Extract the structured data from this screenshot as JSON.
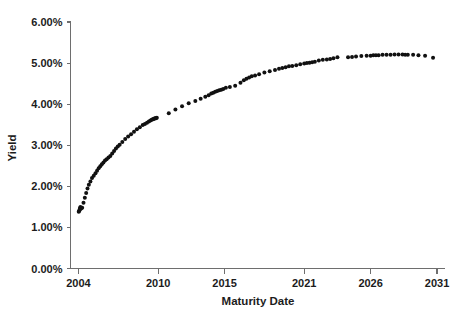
{
  "chart_data": {
    "type": "scatter",
    "title": "",
    "xlabel": "Maturity Date",
    "ylabel": "Yield",
    "xlim": [
      2003.4,
      2031.6
    ],
    "ylim": [
      0.0,
      6.0
    ],
    "grid": false,
    "legend": null,
    "marker": {
      "shape": "circle",
      "color": "#111111",
      "size": 2.0
    },
    "xticks": [
      2004,
      2010,
      2015,
      2021,
      2026,
      2031
    ],
    "xtick_labels": [
      "2004",
      "2010",
      "2015",
      "2021",
      "2026",
      "2031"
    ],
    "yticks": [
      0.0,
      1.0,
      2.0,
      3.0,
      4.0,
      5.0,
      6.0
    ],
    "ytick_labels": [
      "0.00%",
      "1.00%",
      "2.00%",
      "3.00%",
      "4.00%",
      "5.00%",
      "6.00%"
    ],
    "series": [
      {
        "name": "Yield curve",
        "x": [
          2004.02,
          2004.05,
          2004.08,
          2004.1,
          2004.12,
          2004.15,
          2004.2,
          2004.28,
          2004.38,
          2004.48,
          2004.58,
          2004.68,
          2004.78,
          2004.9,
          2005.02,
          2005.15,
          2005.28,
          2005.4,
          2005.52,
          2005.64,
          2005.76,
          2005.88,
          2006.0,
          2006.12,
          2006.26,
          2006.4,
          2006.54,
          2006.68,
          2006.82,
          2006.96,
          2007.1,
          2007.3,
          2007.52,
          2007.74,
          2007.96,
          2008.18,
          2008.4,
          2008.62,
          2008.84,
          2009.0,
          2009.16,
          2009.3,
          2009.42,
          2009.52,
          2009.6,
          2009.66,
          2009.72,
          2009.78,
          2009.84,
          2009.9,
          2010.8,
          2011.3,
          2011.8,
          2012.3,
          2012.8,
          2013.2,
          2013.55,
          2013.8,
          2014.0,
          2014.15,
          2014.3,
          2014.45,
          2014.6,
          2014.75,
          2014.9,
          2015.1,
          2015.4,
          2015.8,
          2016.2,
          2016.45,
          2016.65,
          2016.85,
          2017.05,
          2017.3,
          2017.6,
          2018.0,
          2018.4,
          2018.8,
          2019.1,
          2019.35,
          2019.6,
          2019.85,
          2020.1,
          2020.4,
          2020.7,
          2021.0,
          2021.2,
          2021.4,
          2021.6,
          2021.8,
          2022.1,
          2022.4,
          2022.7,
          2022.95,
          2023.2,
          2023.5,
          2024.3,
          2024.6,
          2024.9,
          2025.3,
          2025.7,
          2026.0,
          2026.2,
          2026.4,
          2026.6,
          2026.9,
          2027.2,
          2027.5,
          2027.8,
          2028.1,
          2028.4,
          2028.6,
          2028.8,
          2029.2,
          2029.6,
          2030.1,
          2030.7
        ],
        "y": [
          1.38,
          1.4,
          1.42,
          1.45,
          1.47,
          1.5,
          1.46,
          1.48,
          1.6,
          1.72,
          1.84,
          1.95,
          2.04,
          2.12,
          2.2,
          2.26,
          2.32,
          2.38,
          2.44,
          2.49,
          2.54,
          2.58,
          2.63,
          2.66,
          2.7,
          2.74,
          2.8,
          2.86,
          2.92,
          2.97,
          3.01,
          3.08,
          3.15,
          3.21,
          3.27,
          3.33,
          3.39,
          3.44,
          3.49,
          3.52,
          3.55,
          3.58,
          3.6,
          3.62,
          3.63,
          3.64,
          3.65,
          3.66,
          3.66,
          3.67,
          3.78,
          3.87,
          3.95,
          4.02,
          4.08,
          4.13,
          4.18,
          4.22,
          4.26,
          4.28,
          4.3,
          4.32,
          4.34,
          4.35,
          4.37,
          4.4,
          4.42,
          4.45,
          4.52,
          4.58,
          4.62,
          4.65,
          4.68,
          4.7,
          4.73,
          4.77,
          4.8,
          4.83,
          4.86,
          4.88,
          4.9,
          4.92,
          4.93,
          4.95,
          4.97,
          4.99,
          5.0,
          5.01,
          5.02,
          5.03,
          5.06,
          5.08,
          5.09,
          5.1,
          5.12,
          5.14,
          5.14,
          5.15,
          5.16,
          5.17,
          5.18,
          5.18,
          5.19,
          5.19,
          5.19,
          5.2,
          5.2,
          5.2,
          5.21,
          5.21,
          5.21,
          5.2,
          5.2,
          5.2,
          5.19,
          5.18,
          5.13
        ]
      }
    ]
  }
}
